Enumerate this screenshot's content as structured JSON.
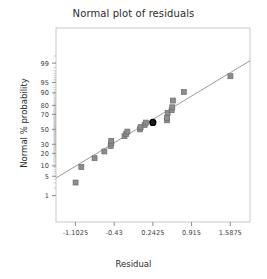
{
  "chart_data": {
    "type": "scatter",
    "title": "Normal plot of residuals",
    "xlabel": "Residual",
    "ylabel": "Normal % probability",
    "grid": false,
    "legend": null,
    "xlim": [
      -1.44,
      1.93
    ],
    "xticks": [
      -1.1025,
      -0.43,
      0.2425,
      0.915,
      1.5875
    ],
    "xtick_labels": [
      "-1.1025",
      "-0.43",
      "0.2425",
      "0.915",
      "1.5875"
    ],
    "yscale": "normal-probability",
    "yticks": [
      1,
      5,
      10,
      20,
      30,
      50,
      70,
      80,
      90,
      95,
      99
    ],
    "ytick_labels": [
      "1",
      "5",
      "10",
      "20",
      "30",
      "50",
      "70",
      "80",
      "90",
      "95",
      "99"
    ],
    "reference_line": {
      "label": "normal reference line",
      "color": "#9a9a9a",
      "x_start": -1.44,
      "y_start": 4.4,
      "x_end": 1.93,
      "y_end": 99.2
    },
    "marker": {
      "shape": "square",
      "fill": "#8c8c8c",
      "edge": "#6e6e6e",
      "size_px": 5
    },
    "highlight_marker": {
      "shape": "circle",
      "fill": "#1a1a1a",
      "edge": "#000000",
      "size_px": 6
    },
    "points": [
      {
        "x": -1.1,
        "y": 3.1,
        "highlight": false
      },
      {
        "x": -1.0,
        "y": 9.4,
        "highlight": false
      },
      {
        "x": -0.77,
        "y": 15.6,
        "highlight": false
      },
      {
        "x": -0.6,
        "y": 21.9,
        "highlight": false
      },
      {
        "x": -0.49,
        "y": 28.1,
        "highlight": false
      },
      {
        "x": -0.48,
        "y": 31.2,
        "highlight": false
      },
      {
        "x": -0.48,
        "y": 34.4,
        "highlight": false
      },
      {
        "x": -0.25,
        "y": 40.6,
        "highlight": false
      },
      {
        "x": -0.22,
        "y": 43.8,
        "highlight": false
      },
      {
        "x": -0.2,
        "y": 46.9,
        "highlight": false
      },
      {
        "x": 0.02,
        "y": 50.0,
        "highlight": false
      },
      {
        "x": 0.03,
        "y": 53.1,
        "highlight": false
      },
      {
        "x": 0.1,
        "y": 56.2,
        "highlight": false
      },
      {
        "x": 0.12,
        "y": 59.4,
        "highlight": false
      },
      {
        "x": 0.2425,
        "y": 59.6,
        "highlight": true
      },
      {
        "x": 0.49,
        "y": 62.5,
        "highlight": false
      },
      {
        "x": 0.49,
        "y": 65.6,
        "highlight": false
      },
      {
        "x": 0.5,
        "y": 71.9,
        "highlight": false
      },
      {
        "x": 0.57,
        "y": 75.0,
        "highlight": false
      },
      {
        "x": 0.58,
        "y": 78.1,
        "highlight": false
      },
      {
        "x": 0.59,
        "y": 84.4,
        "highlight": false
      },
      {
        "x": 0.78,
        "y": 90.6,
        "highlight": false
      },
      {
        "x": 1.59,
        "y": 96.9,
        "highlight": false
      }
    ],
    "minor_tick_color": "#9a9a9a",
    "frame_color": "#c8c8c8",
    "axis_color": "#8a8a8a"
  }
}
